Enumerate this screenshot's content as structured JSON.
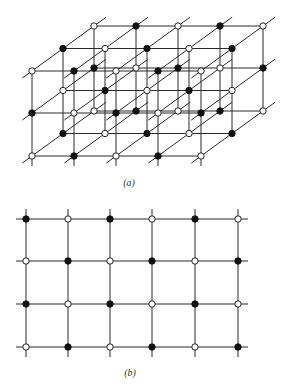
{
  "figure": {
    "width": 292,
    "height": 392,
    "colors": {
      "line": "#2a2a2a",
      "filled_ion": "#111111",
      "open_ion": "#ffffff"
    },
    "node_radius": 3.2
  },
  "panel_a": {
    "label": "(a)",
    "label_pos": {
      "x": 129,
      "y": 177
    },
    "description": "3D rock-salt style lattice, 5 x 3 x 3 nodes, alternating filled and open ions",
    "front_cols_x": [
      32,
      74,
      116,
      158,
      201
    ],
    "front_rows_y": [
      71,
      113,
      156
    ],
    "depth_offset": {
      "dx": 31,
      "dy": -22.5
    },
    "depth_layers": 3,
    "diag_extend": {
      "front": 12,
      "back": 15
    },
    "tick_below": 10,
    "layers": [
      {
        "name": "front",
        "pattern": [
          [
            "open",
            "filled",
            "open",
            "filled",
            "open"
          ],
          [
            "filled",
            "open",
            "filled",
            "open",
            "filled"
          ],
          [
            "open",
            "filled",
            "open",
            "filled",
            "open"
          ]
        ]
      },
      {
        "name": "middle",
        "pattern": [
          [
            "filled",
            "open",
            "filled",
            "open",
            "filled"
          ],
          [
            "open",
            "filled",
            "open",
            "filled",
            "open"
          ],
          [
            "filled",
            "open",
            "filled",
            "open",
            "filled"
          ]
        ]
      },
      {
        "name": "back",
        "pattern": [
          [
            "open",
            "filled",
            "open",
            "filled",
            "open"
          ],
          [
            "filled",
            "open",
            "filled",
            "open",
            "filled"
          ],
          [
            "open",
            "filled",
            "open",
            "filled",
            "open"
          ]
        ]
      }
    ]
  },
  "panel_b": {
    "label": "(b)",
    "label_pos": {
      "x": 130,
      "y": 367
    },
    "description": "2D square lattice cross-section, 6 x 4 nodes, alternating filled and open ions",
    "cols_x": [
      26,
      68,
      110,
      152,
      195,
      238
    ],
    "rows_y": [
      219,
      261,
      304,
      347
    ],
    "line_extend": 10,
    "pattern": [
      [
        "filled",
        "open",
        "filled",
        "open",
        "filled",
        "open"
      ],
      [
        "open",
        "filled",
        "open",
        "filled",
        "open",
        "filled"
      ],
      [
        "filled",
        "open",
        "filled",
        "open",
        "filled",
        "open"
      ],
      [
        "open",
        "filled",
        "open",
        "filled",
        "open",
        "filled"
      ]
    ]
  }
}
